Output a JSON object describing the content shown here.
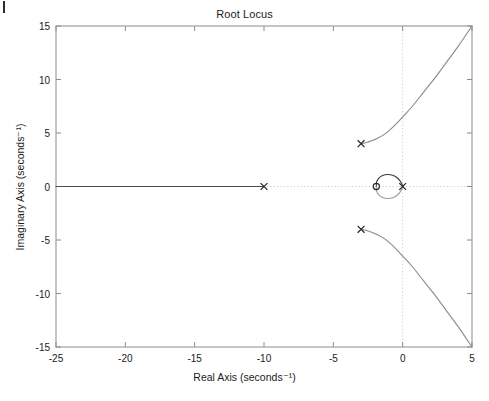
{
  "figure": {
    "title": "Root Locus",
    "width": 489,
    "height": 401,
    "background": "#ffffff",
    "frame_color": "#8c8c8c",
    "grid_color": "#cfcfcf"
  },
  "axes": {
    "x_label": "Real Axis (seconds⁻¹)",
    "y_label": "Imaginary Axis (seconds⁻¹)",
    "x_ticks": [
      "-25",
      "-20",
      "-15",
      "-10",
      "-5",
      "0",
      "5"
    ],
    "y_ticks": [
      "15",
      "10",
      "5",
      "0",
      "-5",
      "-10",
      "-15"
    ]
  },
  "chart_data": {
    "type": "line",
    "title": "Root Locus",
    "xlabel": "Real Axis (seconds⁻¹)",
    "ylabel": "Imaginary Axis (seconds⁻¹)",
    "xlim": [
      -25,
      5
    ],
    "ylim": [
      -15,
      15
    ],
    "xticks": [
      -25,
      -20,
      -15,
      -10,
      -5,
      0,
      5
    ],
    "yticks": [
      -15,
      -10,
      -5,
      0,
      5,
      10,
      15
    ],
    "grid": false,
    "zero_lines": {
      "x": 0,
      "y": 0,
      "style": "dotted",
      "color": "#cfcfcf"
    },
    "legend": null,
    "markers": {
      "poles": [
        {
          "label": "pole",
          "symbol": "x",
          "re": -10,
          "im": 0
        },
        {
          "label": "pole",
          "symbol": "x",
          "re": 0,
          "im": 0
        },
        {
          "label": "pole",
          "symbol": "x",
          "re": -3,
          "im": 4
        },
        {
          "label": "pole",
          "symbol": "x",
          "re": -3,
          "im": -4
        }
      ],
      "zeros": [
        {
          "label": "zero",
          "symbol": "o",
          "re": -1.9,
          "im": 0
        }
      ]
    },
    "branches": [
      {
        "name": "real-axis-branch",
        "color": "#4d4d4d",
        "points": [
          [
            -25,
            0
          ],
          [
            -22,
            0
          ],
          [
            -19,
            0
          ],
          [
            -16,
            0
          ],
          [
            -13,
            0
          ],
          [
            -10,
            0
          ]
        ]
      },
      {
        "name": "circular-branch-upper",
        "color": "#3a3a3a",
        "points": [
          [
            -1.9,
            0
          ],
          [
            -1.88,
            0.42
          ],
          [
            -1.72,
            0.78
          ],
          [
            -1.45,
            1.02
          ],
          [
            -1.1,
            1.12
          ],
          [
            -0.72,
            1.05
          ],
          [
            -0.4,
            0.82
          ],
          [
            -0.16,
            0.48
          ],
          [
            -0.03,
            0.16
          ],
          [
            0,
            0
          ]
        ]
      },
      {
        "name": "circular-branch-lower",
        "color": "#9a9a9a",
        "points": [
          [
            -1.9,
            0
          ],
          [
            -1.88,
            -0.42
          ],
          [
            -1.72,
            -0.78
          ],
          [
            -1.45,
            -1.02
          ],
          [
            -1.1,
            -1.12
          ],
          [
            -0.72,
            -1.05
          ],
          [
            -0.4,
            -0.82
          ],
          [
            -0.16,
            -0.48
          ],
          [
            -0.03,
            -0.16
          ],
          [
            0,
            0
          ]
        ]
      },
      {
        "name": "complex-branch-upper",
        "color": "#8a8a8a",
        "points": [
          [
            -3,
            4
          ],
          [
            -2.6,
            4.12
          ],
          [
            -2.2,
            4.3
          ],
          [
            -1.8,
            4.52
          ],
          [
            -1.4,
            4.8
          ],
          [
            -1.0,
            5.2
          ],
          [
            -0.5,
            5.8
          ],
          [
            0,
            6.5
          ],
          [
            0.7,
            7.5
          ],
          [
            1.5,
            8.8
          ],
          [
            2.3,
            10.1
          ],
          [
            3.1,
            11.5
          ],
          [
            4.0,
            13.1
          ],
          [
            5,
            15
          ]
        ]
      },
      {
        "name": "complex-branch-lower",
        "color": "#8a8a8a",
        "points": [
          [
            -3,
            -4
          ],
          [
            -2.6,
            -4.12
          ],
          [
            -2.2,
            -4.3
          ],
          [
            -1.8,
            -4.52
          ],
          [
            -1.4,
            -4.8
          ],
          [
            -1.0,
            -5.2
          ],
          [
            -0.5,
            -5.8
          ],
          [
            0,
            -6.5
          ],
          [
            0.7,
            -7.5
          ],
          [
            1.5,
            -8.8
          ],
          [
            2.3,
            -10.1
          ],
          [
            3.1,
            -11.5
          ],
          [
            4.0,
            -13.1
          ],
          [
            5,
            -15
          ]
        ]
      }
    ]
  }
}
